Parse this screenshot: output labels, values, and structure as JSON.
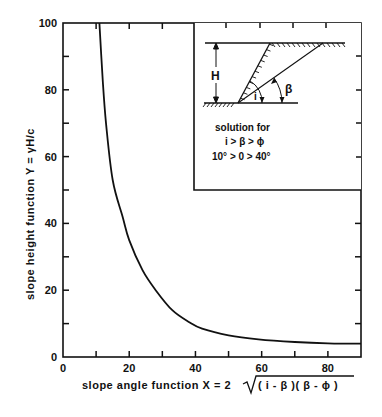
{
  "chart_data": {
    "type": "line",
    "title": "",
    "xlabel": "slope angle function X = 2 √( i - β )( β - ϕ )",
    "ylabel": "slope height function Y = γH/c",
    "xlim": [
      0,
      90
    ],
    "ylim": [
      0,
      100
    ],
    "x_ticks": [
      0,
      20,
      40,
      60,
      80
    ],
    "x_minor_ticks": [
      10,
      30,
      50,
      70
    ],
    "y_ticks": [
      0,
      20,
      40,
      60,
      80,
      100
    ],
    "y_minor_ticks": [
      10,
      30,
      50,
      70,
      90
    ],
    "grid": false,
    "legend": null,
    "series": [
      {
        "name": "Y vs X",
        "x": [
          11,
          12,
          13,
          15,
          18,
          20,
          24,
          28,
          33,
          38,
          42,
          50,
          59,
          70,
          80,
          90
        ],
        "y": [
          100,
          83,
          70,
          53,
          42,
          35,
          26,
          20,
          14,
          10.5,
          8.5,
          6.5,
          5.3,
          4.5,
          4.1,
          4
        ]
      }
    ],
    "annotations": {
      "inset": {
        "labels": [
          "H",
          "i",
          "β"
        ],
        "text": [
          "solution for",
          "i > β > ϕ",
          "10° > 0 > 40°"
        ]
      }
    }
  },
  "axes": {
    "x_tick_labels": [
      "0",
      "20",
      "40",
      "60",
      "80"
    ],
    "y_tick_labels": [
      "0",
      "20",
      "40",
      "60",
      "80",
      "100"
    ],
    "xlabel_prefix": "slope angle function  X = 2",
    "xlabel_radicand": "( i - β )( β - ϕ )",
    "ylabel": "slope height function  Y = γH/c"
  },
  "inset": {
    "h_label": "H",
    "i_label": "i",
    "beta_label": "β",
    "line1": "solution for",
    "line2": "i > β > ϕ",
    "line3": "10° > 0 > 40°"
  },
  "colors": {
    "ink": "#111111",
    "background": "#ffffff"
  }
}
